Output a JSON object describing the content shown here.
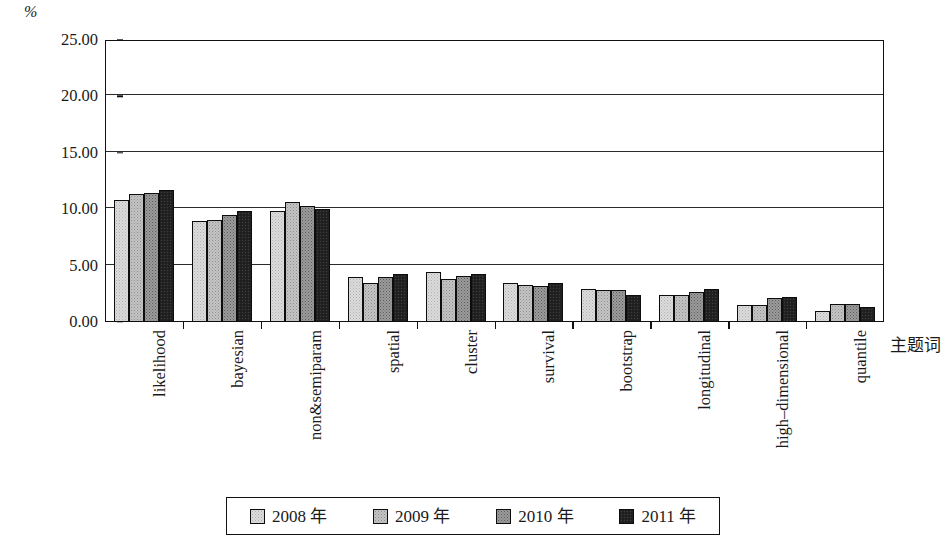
{
  "chart_data": {
    "type": "bar",
    "title": "",
    "subtitle": "",
    "xlabel": "主题词",
    "ylabel": "%",
    "ylim": [
      0,
      25
    ],
    "ytick_labels": [
      "0.00",
      "5.00",
      "10.00",
      "15.00",
      "20.00",
      "25.00"
    ],
    "ytick_values": [
      0,
      5,
      10,
      15,
      20,
      25
    ],
    "grid": true,
    "legend_position": "bottom",
    "categories": [
      "likelihood",
      "bayesian",
      "non&semiparam",
      "spatial",
      "cluster",
      "survival",
      "bootstrap",
      "longitudinal",
      "high–dimensional",
      "quantile"
    ],
    "series": [
      {
        "name": "2008 年",
        "color": "#dcdcdc",
        "values": [
          10.8,
          8.95,
          9.8,
          4.0,
          4.4,
          3.5,
          2.9,
          2.4,
          1.5,
          1.0
        ]
      },
      {
        "name": "2009 年",
        "color": "#c4c4c4",
        "values": [
          11.35,
          9.0,
          10.6,
          3.5,
          3.8,
          3.3,
          2.8,
          2.4,
          1.5,
          1.6
        ]
      },
      {
        "name": "2010 年",
        "color": "#9b9b9b",
        "values": [
          11.4,
          9.5,
          10.3,
          4.0,
          4.1,
          3.2,
          2.8,
          2.7,
          2.1,
          1.6
        ]
      },
      {
        "name": "2011 年",
        "color": "#232323",
        "values": [
          11.7,
          9.8,
          10.0,
          4.3,
          4.3,
          3.5,
          2.4,
          2.9,
          2.2,
          1.3
        ]
      }
    ]
  },
  "legend": {
    "items": [
      {
        "label": "2008 年",
        "swatch": "s0"
      },
      {
        "label": "2009 年",
        "swatch": "s1"
      },
      {
        "label": "2010 年",
        "swatch": "s2"
      },
      {
        "label": "2011 年",
        "swatch": "s3"
      }
    ]
  }
}
